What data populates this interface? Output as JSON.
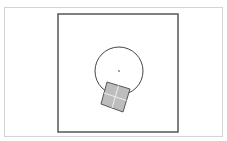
{
  "scene": {
    "background": "#ffffff",
    "frame_color": "#d4d4d4",
    "arena": {
      "x": 58,
      "y": 14,
      "width": 120,
      "height": 118,
      "stroke": "#555555",
      "stroke_width": 1.5
    },
    "circle": {
      "cx": 119,
      "cy": 71,
      "r": 24,
      "stroke": "#444444"
    },
    "center_dot": {
      "cx": 119,
      "cy": 71,
      "r": 1,
      "fill": "#888888"
    },
    "box": {
      "points": [
        [
          107,
          82
        ],
        [
          130,
          89
        ],
        [
          123,
          112
        ],
        [
          101,
          104
        ]
      ],
      "fill": "#bdbdbd",
      "stroke": "#555555",
      "divider_color": "#eeeeee"
    }
  }
}
